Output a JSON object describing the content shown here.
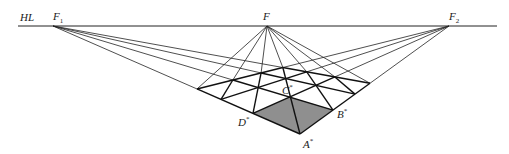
{
  "diagram": {
    "horizon": {
      "label": "HL",
      "y": 26,
      "x1": 18,
      "x2": 497
    },
    "vanishing_points": [
      {
        "id": "F1",
        "label": "F",
        "sub": "1",
        "x": 53,
        "y": 26
      },
      {
        "id": "F",
        "label": "F",
        "sub": "",
        "x": 267,
        "y": 26
      },
      {
        "id": "F2",
        "label": "F",
        "sub": "2",
        "x": 449,
        "y": 26
      }
    ],
    "grid": {
      "corner": {
        "x": 300,
        "y": 134
      },
      "left_edge_x": [
        300,
        253,
        221,
        197
      ],
      "right_edge_x": [
        300,
        333,
        355,
        370
      ]
    },
    "shaded_cell_color": "#8f8f8f",
    "points": [
      {
        "id": "A",
        "label": "A",
        "sup": "*",
        "x": 303,
        "y": 138
      },
      {
        "id": "B",
        "label": "B",
        "sup": "*",
        "x": 337,
        "y": 108
      },
      {
        "id": "C",
        "label": "C",
        "sup": "*",
        "x": 282,
        "y": 84
      },
      {
        "id": "D",
        "label": "D",
        "sup": "*",
        "x": 238,
        "y": 116
      }
    ]
  }
}
